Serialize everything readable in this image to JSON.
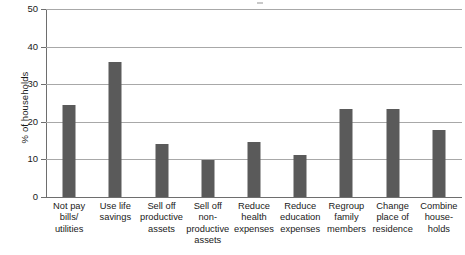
{
  "chart_data": {
    "type": "bar",
    "title": "",
    "subtitle": "",
    "xlabel": "",
    "ylabel": "% of households",
    "ylim": [
      0,
      50
    ],
    "yticks": [
      0,
      10,
      20,
      30,
      40,
      50
    ],
    "ytick_labels": [
      "0",
      "10",
      "20",
      "30",
      "40",
      "50"
    ],
    "grid": "horizontal",
    "legend": "none",
    "orientation": "vertical",
    "bar_color": "#5a5a5a",
    "gridline_color": "#a8a8a8",
    "axis_color": "#6e6e6e",
    "categories": [
      "Not pay bills/ utilities",
      "Use life savings",
      "Sell off productive assets",
      "Sell off non-productive assets",
      "Reduce health expenses",
      "Reduce education expenses",
      "Regroup family members",
      "Change place of residence",
      "Combine house-holds"
    ],
    "category_lines": [
      [
        "Not pay",
        "bills/",
        "utilities"
      ],
      [
        "Use life",
        "savings"
      ],
      [
        "Sell off",
        "productive",
        "assets"
      ],
      [
        "Sell off",
        "non-",
        "productive",
        "assets"
      ],
      [
        "Reduce",
        "health",
        "expenses"
      ],
      [
        "Reduce",
        "education",
        "expenses"
      ],
      [
        "Regroup",
        "family",
        "members"
      ],
      [
        "Change",
        "place of",
        "residence"
      ],
      [
        "Combine",
        "house-",
        "holds"
      ]
    ],
    "values": [
      24.5,
      35.8,
      14.0,
      9.8,
      14.6,
      11.2,
      23.3,
      23.3,
      17.9
    ],
    "series": [
      {
        "name": "% of households",
        "values": [
          24.5,
          35.8,
          14.0,
          9.8,
          14.6,
          11.2,
          23.3,
          23.3,
          17.9
        ]
      }
    ]
  }
}
